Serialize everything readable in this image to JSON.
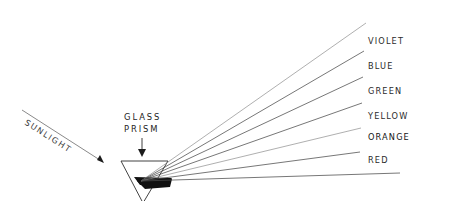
{
  "diagram": {
    "background_color": "#ffffff",
    "ink_color": "#2b2b2b",
    "width": 451,
    "height": 201
  },
  "source_beam": {
    "label": "SUNLIGHT",
    "icon": "arrow-right-down-icon",
    "rotation_degrees": 33,
    "label_x": 24,
    "label_y": 126,
    "line": {
      "x1": 22,
      "y1": 110,
      "x2": 104,
      "y2": 163
    }
  },
  "prism": {
    "label_line_1": "GLASS",
    "label_line_2": "PRISM",
    "label_x": 124,
    "label_y_line_1": 120,
    "label_y_line_2": 132,
    "pointer_icon": "arrow-down-icon",
    "pointer": {
      "x": 142,
      "y_top": 138,
      "y_bottom": 156
    },
    "shape": "inverted-triangle",
    "vertices": {
      "top_left_x": 121,
      "top_right_x": 168,
      "top_y": 161,
      "apex_x": 143,
      "apex_y": 203
    }
  },
  "dispersion_point": {
    "x": 141,
    "y": 181,
    "exit_x": 172,
    "exit_y": 179
  },
  "spectrum": {
    "label_x": 368,
    "rays": [
      {
        "name": "violet",
        "label": "VIOLET",
        "order": 1,
        "end_x": 366,
        "end_y": 23,
        "label_y": 44,
        "emphasis": false,
        "shade": "pale"
      },
      {
        "name": "blue",
        "label": "BLUE",
        "order": 2,
        "end_x": 364,
        "end_y": 51,
        "label_y": 69,
        "emphasis": false,
        "shade": "normal"
      },
      {
        "name": "green",
        "label": "GREEN",
        "order": 3,
        "end_x": 363,
        "end_y": 77,
        "label_y": 94,
        "emphasis": false,
        "shade": "normal"
      },
      {
        "name": "yellow",
        "label": "YELLOW",
        "order": 4,
        "end_x": 362,
        "end_y": 103,
        "label_y": 119,
        "emphasis": false,
        "shade": "normal"
      },
      {
        "name": "orange",
        "label": "ORANGE",
        "order": 5,
        "end_x": 361,
        "end_y": 128,
        "label_y": 140,
        "emphasis": true,
        "shade": "pale"
      },
      {
        "name": "red",
        "label": "RED",
        "order": 6,
        "end_x": 360,
        "end_y": 152,
        "label_y": 163,
        "emphasis": false,
        "shade": "normal"
      },
      {
        "name": "infrared-edge",
        "label": "",
        "order": 7,
        "end_x": 400,
        "end_y": 173,
        "label_y": 0,
        "emphasis": false,
        "shade": "normal"
      }
    ]
  }
}
